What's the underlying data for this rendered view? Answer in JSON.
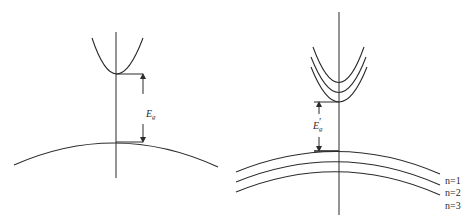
{
  "panels": [
    {
      "id": "bulk",
      "gap_label": "E",
      "gap_subscript": "g",
      "gap_prime": ""
    },
    {
      "id": "quantum-well",
      "gap_label": "E",
      "gap_subscript": "g",
      "gap_prime": "′",
      "subband_labels": [
        "n=1",
        "n=2",
        "n=3"
      ]
    }
  ],
  "colors": {
    "line": "#2b2b2b",
    "background": "#ffffff"
  }
}
